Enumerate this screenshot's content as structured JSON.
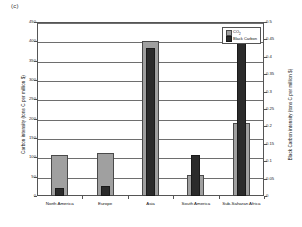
{
  "panel_label": "(c)",
  "chart_data": {
    "type": "bar",
    "title": "",
    "panel": "(c)",
    "categories": [
      "North America",
      "Europe",
      "Asia",
      "South America",
      "Sub-Saharan Africa"
    ],
    "series": [
      {
        "name": "CO2",
        "legend_label": "CO",
        "legend_sub": "2",
        "axis": "left",
        "color": "#a0a0a0",
        "values": [
          105,
          110,
          400,
          55,
          190
        ],
        "units": "tons C per million $"
      },
      {
        "name": "Black Carbon",
        "legend_label": "Black Carbon",
        "axis": "right",
        "color": "#2b2b2b",
        "values": [
          0.022,
          0.028,
          0.425,
          0.118,
          0.442
        ],
        "units": "tons C per million $"
      }
    ],
    "ylabel": "Carbon intensity (tons C per million $)",
    "ylabel_right": "Black Carbon intensity (tons C per million $)",
    "xlabel": "",
    "ylim": [
      0,
      450
    ],
    "ylim_right": [
      0,
      0.5
    ],
    "yticks": [
      "0",
      "50",
      "100",
      "150",
      "200",
      "250",
      "300",
      "350",
      "400",
      "450"
    ],
    "yticks_right": [
      "0",
      "0.05",
      "0.1",
      "0.15",
      "0.2",
      "0.25",
      "0.3",
      "0.35",
      "0.4",
      "0.45",
      "0.5"
    ],
    "grid": true,
    "legend_position": "top-right"
  }
}
